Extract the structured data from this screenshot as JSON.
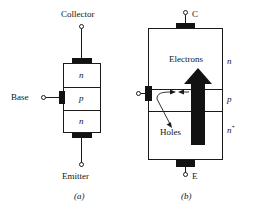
{
  "figure": {
    "type": "bipolar-junction-transistor-diagram",
    "panels": [
      {
        "id": "a",
        "caption": "(a)",
        "terminals": [
          {
            "name": "collector",
            "label": "Collector",
            "position": "top"
          },
          {
            "name": "base",
            "label": "Base",
            "position": "left"
          },
          {
            "name": "emitter",
            "label": "Emitter",
            "position": "bottom"
          }
        ],
        "layers": [
          {
            "label": "n",
            "region": "collector"
          },
          {
            "label": "p",
            "region": "base"
          },
          {
            "label": "n",
            "region": "emitter"
          }
        ]
      },
      {
        "id": "b",
        "caption": "(b)",
        "terminals": [
          {
            "name": "collector",
            "label": "C",
            "position": "top"
          },
          {
            "name": "base",
            "label": "",
            "position": "left"
          },
          {
            "name": "emitter",
            "label": "E",
            "position": "bottom"
          }
        ],
        "layers": [
          {
            "label": "n",
            "region": "collector"
          },
          {
            "label": "p",
            "region": "base"
          },
          {
            "label": "n+",
            "region": "emitter"
          }
        ],
        "annotations": [
          {
            "name": "electrons-flow",
            "label": "Electrons",
            "direction": "up"
          },
          {
            "name": "holes-flow",
            "label": "Holes",
            "direction": "down"
          }
        ]
      }
    ],
    "colors": {
      "ink": "#1a1a1a",
      "fill": "#121212",
      "background": "#ffffff"
    }
  }
}
